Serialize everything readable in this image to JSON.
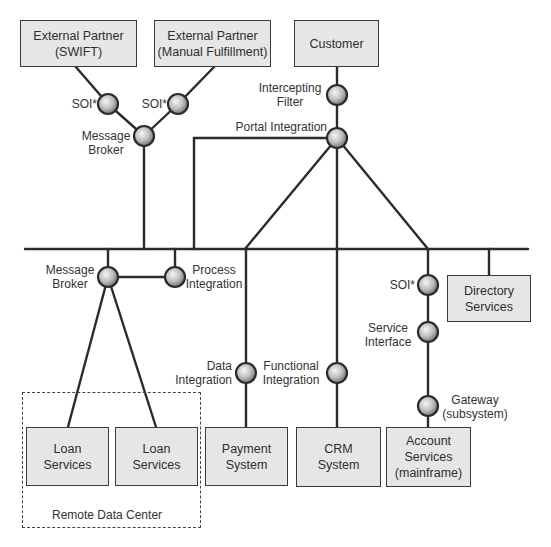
{
  "diagram": {
    "type": "integration-architecture",
    "colors": {
      "line": "#2b2b2b",
      "box_fill": "#e6e6e6",
      "node_light": "#f4f4f4",
      "node_dark": "#7a7a7a"
    },
    "systems": {
      "swift": {
        "line1": "External Partner",
        "line2": "(SWIFT)"
      },
      "manual": {
        "line1": "External Partner",
        "line2": "(Manual Fulfillment)"
      },
      "customer": {
        "line1": "Customer"
      },
      "directory": {
        "line1": "Directory",
        "line2": "Services"
      },
      "loan1": {
        "line1": "Loan",
        "line2": "Services"
      },
      "loan2": {
        "line1": "Loan",
        "line2": "Services"
      },
      "payment": {
        "line1": "Payment",
        "line2": "System"
      },
      "crm": {
        "line1": "CRM",
        "line2": "System"
      },
      "account": {
        "line1": "Account",
        "line2": "Services",
        "line3": "(mainframe)"
      }
    },
    "nodes": {
      "soi_swift": {
        "line1": "SOI*"
      },
      "soi_manual": {
        "line1": "SOI*"
      },
      "broker_top": {
        "line1": "Message",
        "line2": "Broker"
      },
      "intercepting": {
        "line1": "Intercepting",
        "line2": "Filter"
      },
      "portal": {
        "line1": "Portal Integration"
      },
      "broker_bottom": {
        "line1": "Message",
        "line2": "Broker"
      },
      "process": {
        "line1": "Process",
        "line2": "Integration"
      },
      "soi_account": {
        "line1": "SOI*"
      },
      "service_interface": {
        "line1": "Service",
        "line2": "Interface"
      },
      "data_integration": {
        "line1": "Data",
        "line2": "Integration"
      },
      "functional_integration": {
        "line1": "Functional",
        "line2": "Integration"
      },
      "gateway": {
        "line1": "Gateway",
        "line2": "(subsystem)"
      }
    },
    "regions": {
      "remote_data_center": {
        "label": "Remote Data Center"
      }
    }
  }
}
